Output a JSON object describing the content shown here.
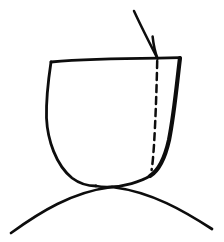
{
  "figure": {
    "title": "Line drawing of a crown-shaped outline with arrow and dashed line",
    "background_color": "#ffffff",
    "ink_color": "#0d0d0d",
    "width": 224,
    "height": 242,
    "style": "hand-drawn black ink line art, no text labels"
  },
  "elements": {
    "crown_outline": {
      "name": "crown-outline",
      "description": "Closed hand-drawn outline: flat top edge, slightly bowed left wall, rounded U-shaped base, thicker tapering right wall",
      "stroke_width": 2.6,
      "top_edge": {
        "x1": 51,
        "y1": 61,
        "x2": 180,
        "y2": 58
      },
      "left_wall": {
        "x_top": 51,
        "y_top": 61,
        "x_bulge": 46,
        "y_bulge": 115,
        "x_bottom": 96,
        "y_bottom": 186
      },
      "base_curve": {
        "x_left": 96,
        "y_left": 186,
        "x_right": 150,
        "y_right": 175
      },
      "right_wall": {
        "x_top": 180,
        "y_top": 58,
        "x_bulge": 172,
        "y_bulge": 120,
        "x_bottom": 150,
        "y_bottom": 175
      }
    },
    "dashed_line": {
      "name": "dashed-margin-line",
      "description": "Vertical dashed line inside the outline, from the top edge down to the lower right curve",
      "x_top": 157,
      "y_top": 60,
      "x_bottom": 152,
      "y_bottom": 170,
      "stroke_width": 2.4,
      "dash_pattern": "7 5"
    },
    "arrow": {
      "name": "pointer-arrow",
      "description": "Curved arrow descending from upper area, tip at the top edge where the dashed line begins, single left barb",
      "shaft_start": {
        "x": 134,
        "y": 11
      },
      "shaft_control": {
        "x": 143,
        "y": 32
      },
      "tip": {
        "x": 158,
        "y": 59
      },
      "barb": {
        "x": 153,
        "y": 38
      },
      "stroke_width": 2.4
    },
    "baseline_arc": {
      "name": "gum-baseline-arc",
      "description": "Wide shallow arc spanning the full image width, meeting the base of the outline near center",
      "x_left": 11,
      "y_left": 233,
      "x_apex": 112,
      "y_apex": 186,
      "x_right": 212,
      "y_right": 229,
      "stroke_width": 2.6
    }
  },
  "labels": {
    "figure_caption": "",
    "annotations": []
  }
}
